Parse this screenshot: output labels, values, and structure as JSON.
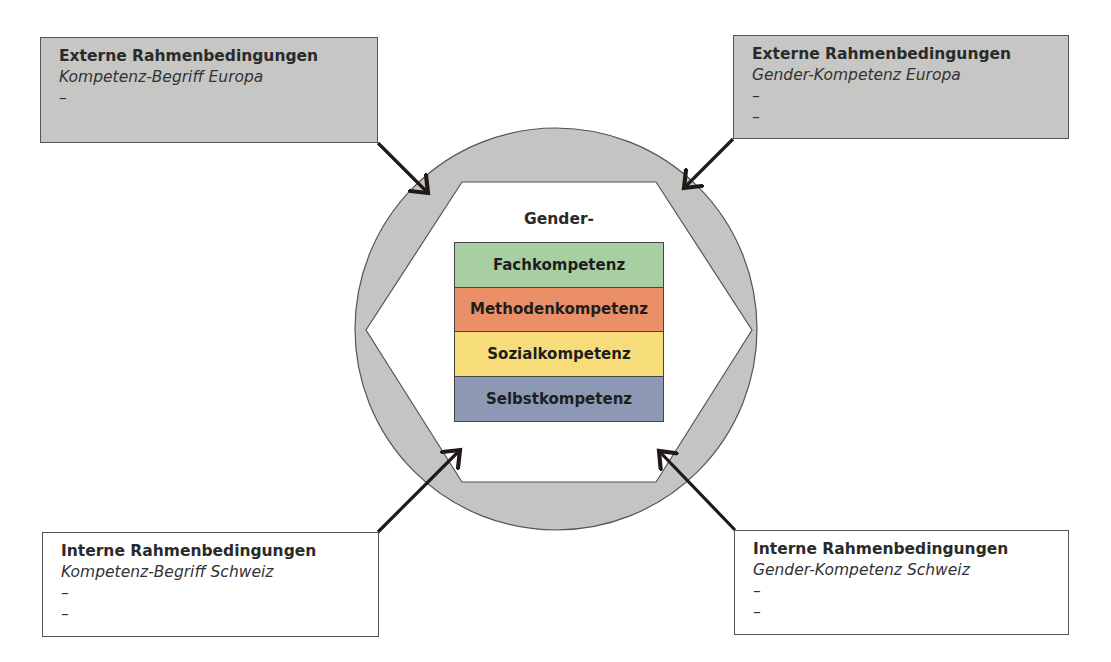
{
  "center": {
    "heading": "Gender-",
    "layers": [
      {
        "label": "Fachkompetenz",
        "color": "#a8cfa3"
      },
      {
        "label": "Methodenkompetenz",
        "color": "#ea8f68"
      },
      {
        "label": "Sozialkompetenz",
        "color": "#f7dd7a"
      },
      {
        "label": "Selbstkompetenz",
        "color": "#8c98b4"
      }
    ]
  },
  "boxes": {
    "top_left": {
      "title": "Externe Rahmenbedingungen",
      "subtitle": "Kompetenz-Begriff Europa",
      "items": [
        "–"
      ]
    },
    "top_right": {
      "title": "Externe Rahmenbedingungen",
      "subtitle": "Gender-Kompetenz Europa",
      "items": [
        "–",
        "–"
      ]
    },
    "bottom_left": {
      "title": "Interne Rahmenbedingungen",
      "subtitle": "Kompetenz-Begriff Schweiz",
      "items": [
        "–",
        "–"
      ]
    },
    "bottom_right": {
      "title": "Interne Rahmenbedingungen",
      "subtitle": "Gender-Kompetenz Schweiz",
      "items": [
        "–",
        "–"
      ]
    }
  },
  "colors": {
    "external_box": "#c6c6c4",
    "ring": "#c4c4c2",
    "arrow": "#1f1a18"
  }
}
